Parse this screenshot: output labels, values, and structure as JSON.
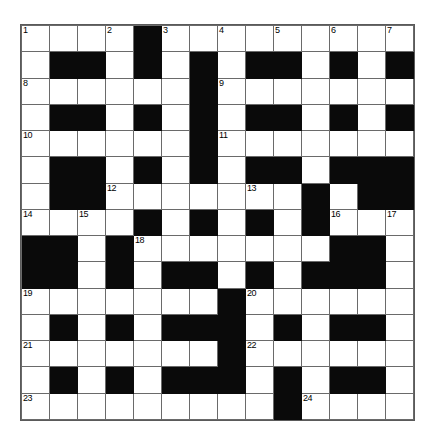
{
  "puzzle": {
    "type": "crossword-grid",
    "title": "Crossword puzzle grid",
    "rows": 14,
    "columns": 14,
    "cell_size_px": 28,
    "colors": {
      "background": "#ffffff",
      "block": "#0a0a0a",
      "grid_line": "#6a6a6a",
      "number_text": "#000000"
    },
    "highest_clue_number": 24,
    "clue_numbers_visible": [
      1,
      2,
      3,
      4,
      5,
      6,
      7,
      8,
      9,
      10,
      11,
      12,
      13,
      14,
      15,
      16,
      17,
      18,
      19,
      20,
      21,
      22,
      23,
      24
    ],
    "grid": [
      [
        "W",
        "W",
        "W",
        "W",
        "B",
        "W",
        "W",
        "W",
        "W",
        "W",
        "W",
        "W",
        "W",
        "W"
      ],
      [
        "W",
        "B",
        "B",
        "W",
        "B",
        "W",
        "B",
        "W",
        "B",
        "B",
        "W",
        "B",
        "W",
        "B"
      ],
      [
        "W",
        "W",
        "W",
        "W",
        "W",
        "W",
        "B",
        "W",
        "W",
        "W",
        "W",
        "W",
        "W",
        "W"
      ],
      [
        "W",
        "B",
        "B",
        "W",
        "B",
        "W",
        "B",
        "W",
        "B",
        "B",
        "W",
        "B",
        "W",
        "B"
      ],
      [
        "W",
        "W",
        "W",
        "W",
        "W",
        "W",
        "B",
        "W",
        "W",
        "W",
        "W",
        "W",
        "W",
        "W"
      ],
      [
        "W",
        "B",
        "B",
        "W",
        "B",
        "W",
        "B",
        "W",
        "B",
        "B",
        "W",
        "B",
        "B",
        "B"
      ],
      [
        "W",
        "B",
        "B",
        "W",
        "W",
        "W",
        "W",
        "W",
        "W",
        "W",
        "B",
        "W",
        "B",
        "B"
      ],
      [
        "W",
        "W",
        "W",
        "W",
        "B",
        "W",
        "B",
        "W",
        "B",
        "W",
        "B",
        "W",
        "W",
        "W"
      ],
      [
        "B",
        "B",
        "W",
        "B",
        "W",
        "W",
        "W",
        "W",
        "W",
        "W",
        "W",
        "B",
        "B",
        "W"
      ],
      [
        "B",
        "B",
        "W",
        "B",
        "W",
        "B",
        "B",
        "W",
        "B",
        "W",
        "B",
        "B",
        "B",
        "W"
      ],
      [
        "W",
        "W",
        "W",
        "W",
        "W",
        "W",
        "W",
        "B",
        "W",
        "W",
        "W",
        "W",
        "W",
        "W"
      ],
      [
        "W",
        "B",
        "W",
        "B",
        "W",
        "B",
        "B",
        "B",
        "W",
        "B",
        "W",
        "B",
        "B",
        "W"
      ],
      [
        "W",
        "W",
        "W",
        "W",
        "W",
        "W",
        "W",
        "B",
        "W",
        "W",
        "W",
        "W",
        "W",
        "W"
      ],
      [
        "W",
        "B",
        "W",
        "B",
        "W",
        "B",
        "B",
        "B",
        "W",
        "B",
        "W",
        "B",
        "B",
        "W"
      ],
      [
        "W",
        "W",
        "W",
        "W",
        "W",
        "W",
        "W",
        "W",
        "W",
        "B",
        "W",
        "W",
        "W",
        "W"
      ]
    ],
    "numbered_cells": [
      {
        "number": 1,
        "row": 0,
        "col": 0
      },
      {
        "number": 2,
        "row": 0,
        "col": 3
      },
      {
        "number": 3,
        "row": 0,
        "col": 5
      },
      {
        "number": 4,
        "row": 0,
        "col": 7
      },
      {
        "number": 5,
        "row": 0,
        "col": 9
      },
      {
        "number": 6,
        "row": 0,
        "col": 11
      },
      {
        "number": 7,
        "row": 0,
        "col": 13
      },
      {
        "number": 8,
        "row": 2,
        "col": 0
      },
      {
        "number": 9,
        "row": 2,
        "col": 7
      },
      {
        "number": 10,
        "row": 4,
        "col": 0
      },
      {
        "number": 11,
        "row": 4,
        "col": 7
      },
      {
        "number": 12,
        "row": 6,
        "col": 3
      },
      {
        "number": 13,
        "row": 6,
        "col": 8
      },
      {
        "number": 14,
        "row": 7,
        "col": 0
      },
      {
        "number": 15,
        "row": 7,
        "col": 2
      },
      {
        "number": 16,
        "row": 7,
        "col": 11
      },
      {
        "number": 17,
        "row": 7,
        "col": 13
      },
      {
        "number": 18,
        "row": 8,
        "col": 4
      },
      {
        "number": 19,
        "row": 10,
        "col": 0
      },
      {
        "number": 20,
        "row": 10,
        "col": 8
      },
      {
        "number": 21,
        "row": 12,
        "col": 0
      },
      {
        "number": 22,
        "row": 12,
        "col": 8
      },
      {
        "number": 23,
        "row": 14,
        "col": 0
      },
      {
        "number": 24,
        "row": 14,
        "col": 10
      }
    ]
  }
}
